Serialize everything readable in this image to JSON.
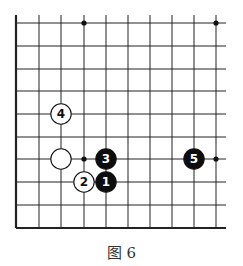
{
  "diagram": {
    "type": "go-board-corner",
    "caption": "图 6",
    "grid": {
      "columns": 10,
      "rows": 10,
      "x": [
        16,
        39,
        61,
        84,
        106,
        128,
        150,
        172,
        194,
        216
      ],
      "y": [
        23,
        46,
        69,
        91,
        114,
        137,
        159,
        182,
        205,
        228
      ],
      "edges": [
        "left",
        "bottom"
      ],
      "line_color": "#222222"
    },
    "star_points": [
      {
        "col": 3,
        "row": 0
      },
      {
        "col": 9,
        "row": 0
      },
      {
        "col": 3,
        "row": 6
      },
      {
        "col": 9,
        "row": 6
      }
    ],
    "stones": [
      {
        "color": "white",
        "col": 2,
        "row": 6,
        "label": ""
      },
      {
        "color": "black",
        "col": 4,
        "row": 7,
        "label": "1"
      },
      {
        "color": "white",
        "col": 3,
        "row": 7,
        "label": "2"
      },
      {
        "color": "black",
        "col": 4,
        "row": 6,
        "label": "3"
      },
      {
        "color": "white",
        "col": 2,
        "row": 4,
        "label": "4"
      },
      {
        "color": "black",
        "col": 8,
        "row": 6,
        "label": "5"
      }
    ]
  }
}
